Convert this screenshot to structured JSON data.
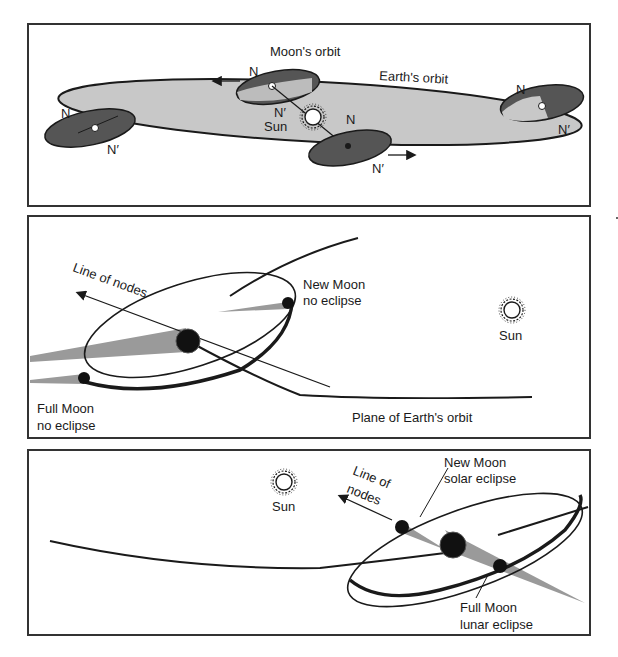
{
  "figure": {
    "colors": {
      "ink": "#1a1a1a",
      "earth_orbit_fill": "#c8c8c8",
      "moon_orbit_fill": "#555555",
      "shadow_gray": "#9a9a9a",
      "panel_border": "#333333"
    }
  },
  "panel_top": {
    "labels": {
      "moons_orbit": "Moon's orbit",
      "earths_orbit": "Earth's orbit",
      "sun": "Sun",
      "node_n_left": "N",
      "node_nprime_left": "N′",
      "node_n_upper": "N",
      "node_nprime_upper": "N′",
      "node_n_lower": "N",
      "node_nprime_lower": "N′",
      "node_n_right": "N",
      "node_nprime_right": "N′"
    },
    "arrows": [
      "arrow-left (upper moon orbit)",
      "arrow-right (lower moon orbit)"
    ]
  },
  "panel_middle": {
    "labels": {
      "line_of_nodes": "Line of nodes",
      "new_moon": "New Moon",
      "new_moon_status": "no eclipse",
      "full_moon": "Full Moon",
      "full_moon_status": "no eclipse",
      "sun": "Sun",
      "plane": "Plane of Earth's orbit"
    }
  },
  "panel_bottom": {
    "labels": {
      "line_of_nodes_1": "Line of",
      "line_of_nodes_2": "nodes",
      "new_moon": "New Moon",
      "new_moon_status": "solar eclipse",
      "full_moon": "Full Moon",
      "full_moon_status": "lunar eclipse",
      "sun": "Sun"
    }
  }
}
